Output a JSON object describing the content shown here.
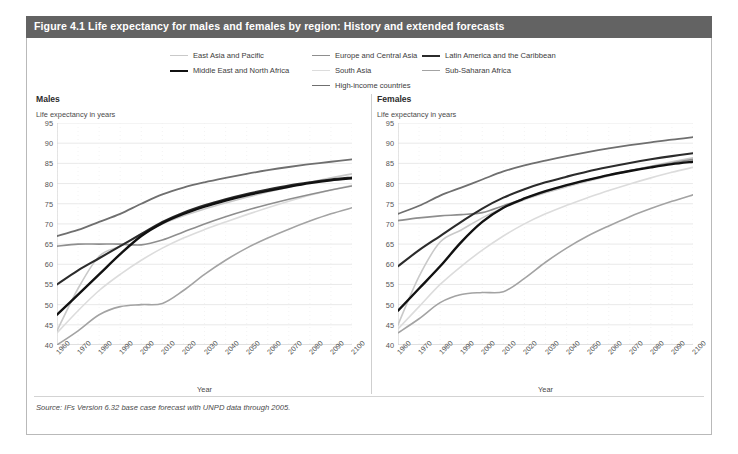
{
  "figure": {
    "title": "Figure 4.1 Life expectancy for males and females by region: History and extended forecasts",
    "source": "Source: IFs Version 6.32 base case forecast with UNPD data through 2005.",
    "title_bar_color": "#636363",
    "panel_border_color": "#b9b9b9",
    "background_color": "#ffffff"
  },
  "legend": {
    "items": [
      {
        "label": "East Asia and Pacific",
        "color": "#c9c9c9",
        "width": 1.6
      },
      {
        "label": "Europe and Central Asia",
        "color": "#8e8e8e",
        "width": 1.6
      },
      {
        "label": "Latin America and the Caribbean",
        "color": "#2b2b2b",
        "width": 2.1
      },
      {
        "label": "Middle East and North Africa",
        "color": "#111111",
        "width": 2.4
      },
      {
        "label": "South Asia",
        "color": "#dcdcdc",
        "width": 1.6
      },
      {
        "label": "Sub-Saharan Africa",
        "color": "#a3a3a3",
        "width": 1.6
      },
      {
        "label": "High-income countries",
        "color": "#6f6f6f",
        "width": 1.8
      }
    ]
  },
  "chart_data": {
    "type": "line",
    "title": "Figure 4.1 Life expectancy for males and females by region: History and extended forecasts",
    "xlabel": "Year",
    "ylabel": "Life expectancy in years",
    "xlim": [
      1960,
      2100
    ],
    "ylim": [
      40,
      95
    ],
    "yticks": [
      40,
      45,
      50,
      55,
      60,
      65,
      70,
      75,
      80,
      85,
      90,
      95
    ],
    "xticks": [
      1960,
      1970,
      1980,
      1990,
      2000,
      2010,
      2020,
      2030,
      2040,
      2050,
      2060,
      2070,
      2080,
      2090,
      2100
    ],
    "grid": true,
    "legend_position": "top",
    "panels": [
      {
        "name": "Males",
        "subtitle": "Life expectancy in years",
        "xlabel": "Year",
        "x": [
          1960,
          1970,
          1980,
          1990,
          2000,
          2010,
          2020,
          2030,
          2040,
          2050,
          2060,
          2070,
          2080,
          2090,
          2100
        ],
        "series": [
          {
            "name": "East Asia and Pacific",
            "color": "#c9c9c9",
            "width": 1.6,
            "values": [
              43.5,
              54.0,
              62.0,
              64.5,
              67.5,
              70.0,
              72.0,
              73.7,
              75.2,
              76.6,
              77.9,
              79.1,
              80.3,
              81.4,
              82.4
            ]
          },
          {
            "name": "Europe and Central Asia",
            "color": "#8e8e8e",
            "width": 1.6,
            "values": [
              64.5,
              65.0,
              65.0,
              65.0,
              64.8,
              66.0,
              68.0,
              70.0,
              71.8,
              73.4,
              74.8,
              76.1,
              77.3,
              78.4,
              79.4
            ]
          },
          {
            "name": "Latin America and the Caribbean",
            "color": "#2b2b2b",
            "width": 2.1,
            "values": [
              55.0,
              58.5,
              61.5,
              64.5,
              67.5,
              70.5,
              72.8,
              74.6,
              76.1,
              77.4,
              78.5,
              79.5,
              80.3,
              81.0,
              81.5
            ]
          },
          {
            "name": "Middle East and North Africa",
            "color": "#111111",
            "width": 2.4,
            "values": [
              47.5,
              52.5,
              57.5,
              62.5,
              67.0,
              70.2,
              72.5,
              74.3,
              75.8,
              77.1,
              78.2,
              79.2,
              80.1,
              80.8,
              81.3
            ]
          },
          {
            "name": "South Asia",
            "color": "#dcdcdc",
            "width": 1.6,
            "values": [
              43.0,
              48.5,
              53.5,
              57.5,
              61.0,
              64.0,
              66.5,
              68.6,
              70.5,
              72.3,
              74.0,
              75.6,
              77.1,
              78.4,
              79.6
            ]
          },
          {
            "name": "Sub-Saharan Africa",
            "color": "#a3a3a3",
            "width": 1.6,
            "values": [
              40.0,
              43.5,
              47.5,
              49.5,
              50.0,
              50.3,
              53.5,
              57.5,
              61.0,
              64.0,
              66.5,
              68.7,
              70.7,
              72.5,
              74.0
            ]
          },
          {
            "name": "High-income countries",
            "color": "#6f6f6f",
            "width": 1.8,
            "values": [
              67.0,
              68.5,
              70.5,
              72.5,
              75.0,
              77.3,
              79.0,
              80.3,
              81.4,
              82.4,
              83.3,
              84.1,
              84.8,
              85.4,
              86.0
            ]
          }
        ]
      },
      {
        "name": "Females",
        "subtitle": "Life expectancy in years",
        "xlabel": "Year",
        "x": [
          1960,
          1970,
          1980,
          1990,
          2000,
          2010,
          2020,
          2030,
          2040,
          2050,
          2060,
          2070,
          2080,
          2090,
          2100
        ],
        "series": [
          {
            "name": "East Asia and Pacific",
            "color": "#c9c9c9",
            "width": 1.6,
            "values": [
              45.0,
              57.0,
              65.5,
              68.5,
              71.5,
              74.0,
              76.0,
              77.7,
              79.2,
              80.6,
              81.9,
              83.1,
              84.3,
              85.4,
              86.4
            ]
          },
          {
            "name": "Europe and Central Asia",
            "color": "#8e8e8e",
            "width": 1.6,
            "values": [
              70.8,
              71.5,
              72.0,
              72.3,
              72.8,
              74.5,
              76.3,
              78.0,
              79.5,
              80.9,
              82.1,
              83.2,
              84.2,
              85.1,
              86.0
            ]
          },
          {
            "name": "Latin America and the Caribbean",
            "color": "#2b2b2b",
            "width": 2.1,
            "values": [
              59.5,
              63.5,
              67.0,
              70.5,
              73.8,
              76.5,
              78.6,
              80.3,
              81.7,
              83.0,
              84.1,
              85.1,
              86.0,
              86.8,
              87.5
            ]
          },
          {
            "name": "Middle East and North Africa",
            "color": "#111111",
            "width": 2.4,
            "values": [
              48.5,
              54.0,
              59.5,
              65.5,
              70.5,
              74.0,
              76.3,
              78.1,
              79.6,
              80.9,
              82.1,
              83.1,
              84.0,
              84.8,
              85.4
            ]
          },
          {
            "name": "South Asia",
            "color": "#dcdcdc",
            "width": 1.6,
            "values": [
              44.0,
              49.5,
              55.0,
              59.5,
              63.5,
              67.0,
              70.0,
              72.5,
              74.6,
              76.5,
              78.3,
              79.9,
              81.4,
              82.8,
              84.0
            ]
          },
          {
            "name": "Sub-Saharan Africa",
            "color": "#a3a3a3",
            "width": 1.6,
            "values": [
              43.0,
              46.5,
              50.5,
              52.5,
              53.0,
              53.2,
              56.5,
              60.5,
              64.0,
              67.0,
              69.5,
              71.8,
              73.8,
              75.6,
              77.2
            ]
          },
          {
            "name": "High-income countries",
            "color": "#6f6f6f",
            "width": 1.8,
            "values": [
              72.5,
              74.5,
              77.0,
              79.0,
              81.0,
              83.0,
              84.5,
              85.7,
              86.8,
              87.8,
              88.7,
              89.5,
              90.2,
              90.9,
              91.5
            ]
          }
        ]
      }
    ]
  }
}
